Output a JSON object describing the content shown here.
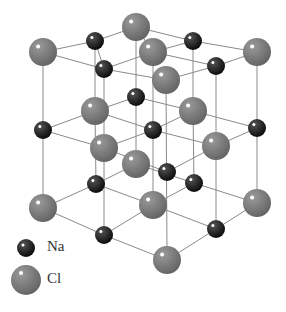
{
  "diagram": {
    "colors": {
      "na": "#1a1a1a",
      "cl": "#7a7a7a",
      "bond": "#8a8a8a"
    },
    "atoms": [
      {
        "el": "Cl",
        "x": 43,
        "y": 52
      },
      {
        "el": "Na",
        "x": 95,
        "y": 41
      },
      {
        "el": "Cl",
        "x": 136,
        "y": 27
      },
      {
        "el": "Cl",
        "x": 153,
        "y": 52
      },
      {
        "el": "Na",
        "x": 193,
        "y": 41
      },
      {
        "el": "Cl",
        "x": 257,
        "y": 52
      },
      {
        "el": "Na",
        "x": 104,
        "y": 69
      },
      {
        "el": "Na",
        "x": 216,
        "y": 66
      },
      {
        "el": "Cl",
        "x": 166,
        "y": 80
      },
      {
        "el": "Na",
        "x": 136,
        "y": 97
      },
      {
        "el": "Cl",
        "x": 95,
        "y": 111
      },
      {
        "el": "Cl",
        "x": 193,
        "y": 111
      },
      {
        "el": "Na",
        "x": 43,
        "y": 130
      },
      {
        "el": "Na",
        "x": 153,
        "y": 130
      },
      {
        "el": "Na",
        "x": 257,
        "y": 128
      },
      {
        "el": "Cl",
        "x": 104,
        "y": 148
      },
      {
        "el": "Cl",
        "x": 216,
        "y": 146
      },
      {
        "el": "Cl",
        "x": 136,
        "y": 164
      },
      {
        "el": "Na",
        "x": 167,
        "y": 172
      },
      {
        "el": "Na",
        "x": 96,
        "y": 184
      },
      {
        "el": "Na",
        "x": 194,
        "y": 183
      },
      {
        "el": "Cl",
        "x": 43,
        "y": 208
      },
      {
        "el": "Cl",
        "x": 153,
        "y": 205
      },
      {
        "el": "Cl",
        "x": 257,
        "y": 203
      },
      {
        "el": "Na",
        "x": 104,
        "y": 235
      },
      {
        "el": "Na",
        "x": 216,
        "y": 229
      },
      {
        "el": "Cl",
        "x": 167,
        "y": 260
      }
    ]
  },
  "legend": {
    "items": [
      {
        "label": "Na",
        "symbol": "na"
      },
      {
        "label": "Cl",
        "symbol": "cl"
      }
    ]
  }
}
